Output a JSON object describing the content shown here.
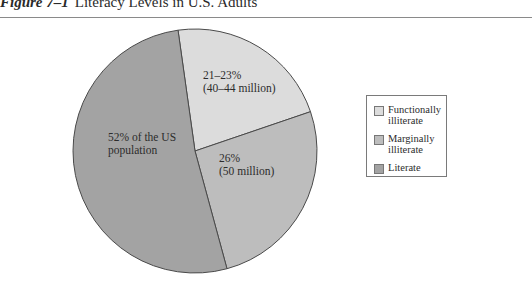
{
  "figure": {
    "number": "Figure 7–1",
    "title": "Literacy Levels in U.S. Adults"
  },
  "slice_labels": {
    "functionally_illiterate": [
      "21–23%",
      "(40–44 million)"
    ],
    "marginally_illiterate": [
      "26%",
      "(50 million)"
    ],
    "literate": [
      "52% of the US",
      "population"
    ]
  },
  "legend": {
    "items": [
      {
        "label": "Functionally illiterate",
        "color": "#dcdcdc"
      },
      {
        "label": "Marginally illiterate",
        "color": "#bdbdbd"
      },
      {
        "label": "Literate",
        "color": "#a3a3a3"
      }
    ]
  },
  "chart_data": {
    "type": "pie",
    "title": "Literacy Levels in U.S. Adults",
    "categories": [
      "Functionally illiterate",
      "Marginally illiterate",
      "Literate"
    ],
    "values": [
      22,
      26,
      52
    ],
    "value_labels": [
      "21–23% (40–44 million)",
      "26% (50 million)",
      "52% of the US population"
    ],
    "colors": [
      "#dcdcdc",
      "#bdbdbd",
      "#a3a3a3"
    ],
    "legend_position": "right",
    "start_angle_deg": -8
  }
}
